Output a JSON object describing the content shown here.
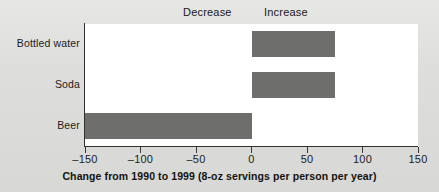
{
  "chart_data": {
    "type": "bar",
    "orientation": "horizontal",
    "title": "",
    "xlabel": "Change from 1990 to 1999 (8-oz servings per person per year)",
    "ylabel": "",
    "categories": [
      "Bottled water",
      "Soda",
      "Beer"
    ],
    "values": [
      75,
      75,
      -150
    ],
    "xlim": [
      -150,
      150
    ],
    "xticks": [
      -150,
      -100,
      -50,
      0,
      150
    ],
    "xtick_labels": [
      "–150",
      "–100",
      "–50",
      "0",
      "50",
      "100",
      "150"
    ],
    "xtick_values": [
      -150,
      -100,
      -50,
      0,
      50,
      100,
      150
    ],
    "grid": false,
    "legend": "none",
    "annotations": [
      {
        "text": "Decrease",
        "side": "left"
      },
      {
        "text": "Increase",
        "side": "right"
      }
    ],
    "series": [
      {
        "name": "Change in servings",
        "values": [
          75,
          75,
          -150
        ]
      }
    ],
    "bar_color": "#6e6e6d",
    "panel_color": "#ffffff",
    "axis_color": "#33322f",
    "background_color": "#dcdcda"
  },
  "figure": {
    "x_axis_title": "Change from 1990 to 1999 (8-oz servings per person per year)",
    "decrease_label": "Decrease",
    "increase_label": "Increase",
    "category_labels": [
      "Bottled water",
      "Soda",
      "Beer"
    ],
    "tick_labels": [
      "–150",
      "–100",
      "–50",
      "0",
      "50",
      "100",
      "150"
    ]
  }
}
